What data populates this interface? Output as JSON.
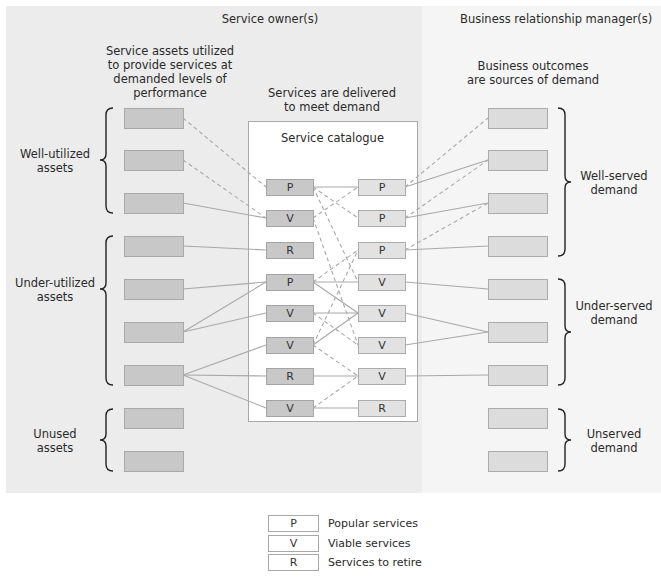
{
  "headers": {
    "left": "Service owner(s)",
    "right": "Business relationship manager(s)"
  },
  "subheaders": {
    "assets": [
      "Service assets utilized",
      "to provide services at",
      "demanded levels of",
      "performance"
    ],
    "services": [
      "Services are delivered",
      "to meet demand"
    ],
    "outcomes": [
      "Business outcomes",
      "are sources of demand"
    ]
  },
  "catalogue": {
    "title": "Service catalogue",
    "left_column": [
      "P",
      "V",
      "R",
      "P",
      "V",
      "V",
      "R",
      "V"
    ],
    "right_column": [
      "P",
      "P",
      "P",
      "V",
      "V",
      "V",
      "V",
      "R"
    ]
  },
  "asset_groups": [
    {
      "label": [
        "Well-utilized",
        "assets"
      ],
      "count": 3
    },
    {
      "label": [
        "Under-utilized",
        "assets"
      ],
      "count": 4
    },
    {
      "label": [
        "Unused",
        "assets"
      ],
      "count": 2
    }
  ],
  "demand_groups": [
    {
      "label": [
        "Well-served",
        "demand"
      ],
      "count": 4
    },
    {
      "label": [
        "Under-served",
        "demand"
      ],
      "count": 3
    },
    {
      "label": [
        "Unserved",
        "demand"
      ],
      "count": 2
    }
  ],
  "legend": [
    {
      "key": "P",
      "label": "Popular services"
    },
    {
      "key": "V",
      "label": "Viable services"
    },
    {
      "key": "R",
      "label": "Services to retire"
    }
  ],
  "colors": {
    "left_panel": "#ececec",
    "right_panel": "#f5f5f5",
    "asset_fill": "#c8c8c8",
    "demand_fill": "#dcdcdc",
    "line": "#a8a8a8"
  }
}
